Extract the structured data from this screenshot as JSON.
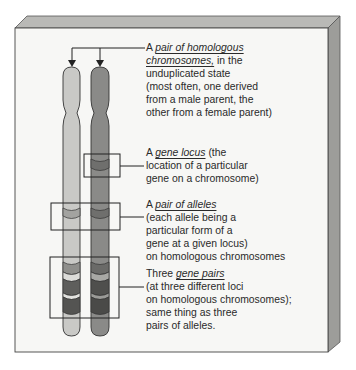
{
  "colors": {
    "panel_front": "#f7f7f5",
    "panel_top": "#b9b9b6",
    "panel_side": "#9d9d9a",
    "outline": "#333333",
    "chromosome_light": "#c9c9c6",
    "chromosome_dark": "#8a8a88",
    "band_light_a": "#a3a3a0",
    "band_light_b": "#d8d8d5",
    "band_light_c": "#6a6a68",
    "band_dark_a": "#6f6f6d",
    "band_dark_b": "#a8a8a5",
    "band_dark_c": "#4f4f4d"
  },
  "diagram": {
    "chromosomes": [
      {
        "name": "light-chromosome",
        "parent": "one parent"
      },
      {
        "name": "dark-chromosome",
        "parent": "other parent"
      }
    ],
    "annotations": [
      {
        "id": "homologous-pair",
        "lines": [
          {
            "pre": "A ",
            "em": "pair of homologous",
            "post": ""
          },
          {
            "pre": "",
            "em": "chromosomes,",
            "post": " in the"
          },
          {
            "pre": "unduplicated state",
            "em": "",
            "post": ""
          },
          {
            "pre": "(most often, one derived",
            "em": "",
            "post": ""
          },
          {
            "pre": "from a male parent, the",
            "em": "",
            "post": ""
          },
          {
            "pre": "other from a female parent)",
            "em": "",
            "post": ""
          }
        ]
      },
      {
        "id": "gene-locus",
        "lines": [
          {
            "pre": "A ",
            "em": "gene locus",
            "post": " (the"
          },
          {
            "pre": "location of a particular",
            "em": "",
            "post": ""
          },
          {
            "pre": "gene on a chromosome)",
            "em": "",
            "post": ""
          }
        ]
      },
      {
        "id": "pair-of-alleles",
        "lines": [
          {
            "pre": "A ",
            "em": "pair of alleles",
            "post": ""
          },
          {
            "pre": "(each allele being a",
            "em": "",
            "post": ""
          },
          {
            "pre": "particular form of a",
            "em": "",
            "post": ""
          },
          {
            "pre": "gene at a given locus)",
            "em": "",
            "post": ""
          },
          {
            "pre": "on homologous chromosomes",
            "em": "",
            "post": ""
          }
        ]
      },
      {
        "id": "three-gene-pairs",
        "lines": [
          {
            "pre": "Three ",
            "em": "gene pairs",
            "post": ""
          },
          {
            "pre": "(at three different loci",
            "em": "",
            "post": ""
          },
          {
            "pre": "on homologous chromosomes);",
            "em": "",
            "post": ""
          },
          {
            "pre": "same thing as three",
            "em": "",
            "post": ""
          },
          {
            "pre": "pairs of alleles.",
            "em": "",
            "post": ""
          }
        ]
      }
    ]
  }
}
